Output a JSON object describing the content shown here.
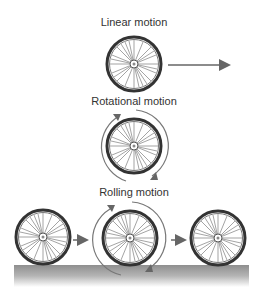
{
  "diagram": {
    "sections": [
      {
        "id": "linear",
        "label": "Linear motion"
      },
      {
        "id": "rotational",
        "label": "Rotational motion"
      },
      {
        "id": "rolling",
        "label": "Rolling motion"
      }
    ]
  },
  "colors": {
    "tire": "#3a3a3a",
    "spoke": "#555555",
    "arrow": "#666666",
    "ground_top": "#8e8e8e",
    "ground_bottom": "#ffffff"
  }
}
